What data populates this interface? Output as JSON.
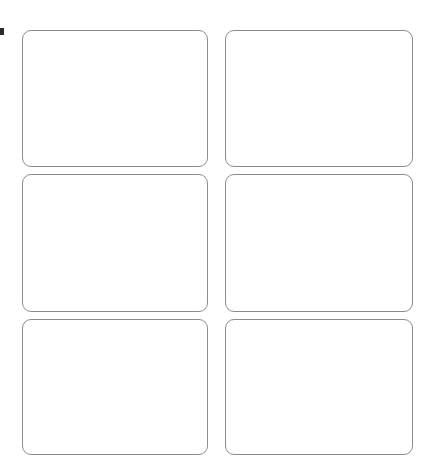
{
  "page": {
    "background_color": "#ffffff",
    "width": 426,
    "height": 470
  },
  "edge_marker": {
    "name": "clipped-glyph-fragment",
    "text": "",
    "color": "#2b2b2b"
  },
  "card_grid": {
    "columns": 2,
    "rows": 3,
    "border_color": "#8d8d8d",
    "fill_color": "#ffffff",
    "corner_radius": "9px",
    "cards": [
      {
        "id": "card-1",
        "label": ""
      },
      {
        "id": "card-2",
        "label": ""
      },
      {
        "id": "card-3",
        "label": ""
      },
      {
        "id": "card-4",
        "label": ""
      },
      {
        "id": "card-5",
        "label": ""
      },
      {
        "id": "card-6",
        "label": ""
      }
    ]
  }
}
